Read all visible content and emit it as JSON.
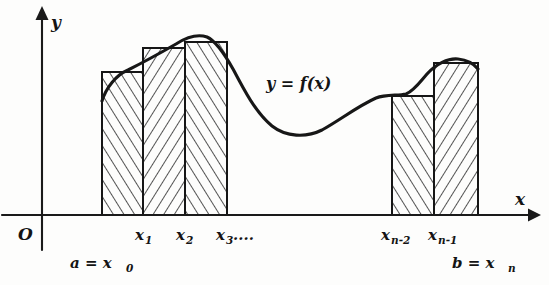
{
  "figure": {
    "background_color": "#fdfdfc",
    "ink_color": "#161616",
    "axes": {
      "y_axis_label": "y",
      "x_axis_label": "x",
      "origin_label": "O",
      "x_axis_y_px": 215,
      "y_axis_x_px": 42
    },
    "function_label": "y = f(x)",
    "tick_labels": [
      {
        "name": "x1",
        "base": "x",
        "sub": "1",
        "x_px": 141
      },
      {
        "name": "x2",
        "base": "x",
        "sub": "2",
        "x_px": 183
      },
      {
        "name": "x3",
        "base": "x",
        "sub": "3",
        "suffix": "....",
        "x_px": 224
      },
      {
        "name": "xn-2",
        "base": "x",
        "sub": "n-2",
        "x_px": 398
      },
      {
        "name": "xn-1",
        "base": "x",
        "sub": "n-1",
        "x_px": 444
      }
    ],
    "endpoint_labels": [
      {
        "name": "a-equals-x0",
        "text": "a = x",
        "sub": "0",
        "x_px": 70,
        "y_px": 266
      },
      {
        "name": "b-equals-xn",
        "text": "b = x",
        "sub": "n",
        "x_px": 452,
        "y_px": 266
      }
    ],
    "bars": [
      {
        "name": "bar-1",
        "x0": 102,
        "x1": 143,
        "top_y": 72,
        "hatch": "up-right"
      },
      {
        "name": "bar-2",
        "x0": 143,
        "x1": 185,
        "top_y": 48,
        "hatch": "up-left"
      },
      {
        "name": "bar-3",
        "x0": 185,
        "x1": 227,
        "top_y": 42,
        "hatch": "up-right"
      },
      {
        "name": "bar-n-1",
        "x0": 392,
        "x1": 434,
        "top_y": 96,
        "hatch": "up-right"
      },
      {
        "name": "bar-n",
        "x0": 434,
        "x1": 478,
        "top_y": 63,
        "hatch": "up-left"
      }
    ],
    "curve_points": [
      {
        "x": 102,
        "y": 101
      },
      {
        "x": 112,
        "y": 82
      },
      {
        "x": 128,
        "y": 70
      },
      {
        "x": 150,
        "y": 57
      },
      {
        "x": 172,
        "y": 46
      },
      {
        "x": 190,
        "y": 38
      },
      {
        "x": 205,
        "y": 36
      },
      {
        "x": 221,
        "y": 44
      },
      {
        "x": 238,
        "y": 66
      },
      {
        "x": 258,
        "y": 96
      },
      {
        "x": 278,
        "y": 120
      },
      {
        "x": 298,
        "y": 134
      },
      {
        "x": 318,
        "y": 134
      },
      {
        "x": 340,
        "y": 121
      },
      {
        "x": 362,
        "y": 104
      },
      {
        "x": 386,
        "y": 95
      },
      {
        "x": 404,
        "y": 96
      },
      {
        "x": 418,
        "y": 88
      },
      {
        "x": 432,
        "y": 71
      },
      {
        "x": 448,
        "y": 60
      },
      {
        "x": 464,
        "y": 60
      },
      {
        "x": 478,
        "y": 68
      }
    ]
  }
}
